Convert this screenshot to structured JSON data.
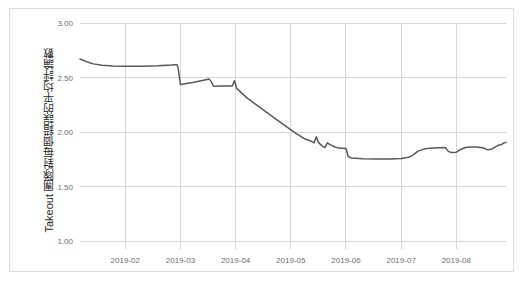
{
  "card": {
    "background_color": "#ffffff",
    "border_color": "#dcdcdc"
  },
  "chart_data": {
    "type": "line",
    "title": "",
    "subtitle": "",
    "xlabel": "",
    "ylabel": "Takeout 團隊對每個錯誤的平均評論數",
    "ylim": [
      1.0,
      3.0
    ],
    "y_ticks": [
      "1.00",
      "1.50",
      "2.00",
      "2.50",
      "3.00"
    ],
    "y_tick_values": [
      1.0,
      1.5,
      2.0,
      2.5,
      3.0
    ],
    "x_ticks": [
      "2019-02",
      "2019-03",
      "2019-04",
      "2019-05",
      "2019-06",
      "2019-07",
      "2019-08"
    ],
    "x_tick_positions": [
      1,
      2,
      3,
      4,
      5,
      6,
      7
    ],
    "xlim": [
      0.18,
      7.9
    ],
    "grid": true,
    "grid_color": "#d6d6d6",
    "legend": "none",
    "series": [
      {
        "name": "Takeout average comments per bug",
        "color": "#595959",
        "x": [
          0.18,
          0.3,
          0.42,
          0.58,
          0.78,
          1.0,
          1.3,
          1.6,
          1.84,
          1.9,
          1.94,
          1.96,
          2.0,
          2.22,
          2.44,
          2.52,
          2.56,
          2.6,
          2.76,
          2.88,
          2.94,
          2.98,
          3.02,
          3.2,
          3.44,
          3.7,
          3.92,
          4.1,
          4.26,
          4.36,
          4.42,
          4.46,
          4.5,
          4.56,
          4.62,
          4.66,
          4.72,
          4.8,
          4.88,
          4.94,
          5.0,
          5.04,
          5.1,
          5.3,
          5.55,
          5.8,
          6.0,
          6.14,
          6.22,
          6.3,
          6.42,
          6.52,
          6.6,
          6.7,
          6.8,
          6.86,
          6.92,
          7.0,
          7.08,
          7.16,
          7.26,
          7.36,
          7.48,
          7.56,
          7.64,
          7.7,
          7.76,
          7.82,
          7.86,
          7.9
        ],
        "y": [
          2.67,
          2.645,
          2.625,
          2.612,
          2.606,
          2.603,
          2.604,
          2.608,
          2.615,
          2.618,
          2.618,
          2.58,
          2.435,
          2.455,
          2.478,
          2.487,
          2.46,
          2.42,
          2.421,
          2.422,
          2.423,
          2.47,
          2.4,
          2.315,
          2.225,
          2.13,
          2.05,
          1.985,
          1.935,
          1.918,
          1.9,
          1.955,
          1.905,
          1.875,
          1.857,
          1.9,
          1.882,
          1.862,
          1.852,
          1.85,
          1.848,
          1.775,
          1.762,
          1.755,
          1.752,
          1.752,
          1.757,
          1.768,
          1.79,
          1.822,
          1.845,
          1.852,
          1.854,
          1.856,
          1.857,
          1.82,
          1.812,
          1.815,
          1.84,
          1.858,
          1.862,
          1.862,
          1.855,
          1.838,
          1.842,
          1.862,
          1.878,
          1.885,
          1.9,
          1.905
        ]
      }
    ]
  }
}
